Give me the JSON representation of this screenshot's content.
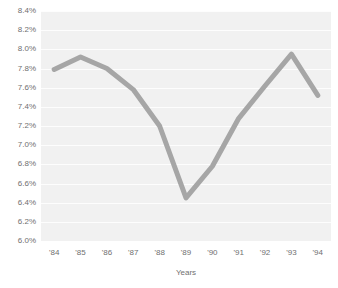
{
  "chart_data": {
    "type": "line",
    "title": "",
    "subtitle": "",
    "xlabel": "Years",
    "ylabel": "",
    "categories": [
      "'84",
      "'85",
      "'86",
      "'87",
      "'88",
      "'89",
      "'90",
      "'91",
      "'92",
      "'93",
      "'94"
    ],
    "values": [
      7.79,
      7.92,
      7.8,
      7.58,
      7.2,
      6.45,
      6.78,
      7.28,
      7.62,
      7.95,
      7.52
    ],
    "series": [
      {
        "name": "",
        "values": [
          7.79,
          7.92,
          7.8,
          7.58,
          7.2,
          6.45,
          6.78,
          7.28,
          7.62,
          7.95,
          7.52
        ]
      }
    ],
    "ylim": [
      6.0,
      8.4
    ],
    "ytick_values": [
      6.0,
      6.2,
      6.4,
      6.6,
      6.8,
      7.0,
      7.2,
      7.4,
      7.6,
      7.8,
      8.0,
      8.2,
      8.4
    ],
    "ytick_labels": [
      "6.0%",
      "6.2%",
      "6.4%",
      "6.6%",
      "6.8%",
      "7.0%",
      "7.2%",
      "7.4%",
      "7.6%",
      "7.8%",
      "8.0%",
      "8.2%",
      "8.4%"
    ],
    "xtick_labels": [
      "'84",
      "'85",
      "'86",
      "'87",
      "'88",
      "'89",
      "'90",
      "'91",
      "'92",
      "'93",
      "'94"
    ],
    "grid": true,
    "grid_orientation": "horizontal",
    "legend": false,
    "legend_position": "none",
    "annotations": [],
    "colors": {
      "line": "#a6a6a6",
      "plot_background": "#f1f1f1",
      "gridline": "#fdfdfd",
      "tick_label": "#6f6f6f",
      "axis_title": "#6f6f6f",
      "page_background": "#ffffff"
    },
    "line_width": 5
  }
}
